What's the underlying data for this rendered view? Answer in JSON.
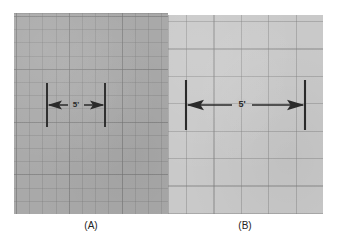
{
  "figure": {
    "background_color": "#ffffff",
    "panels": [
      {
        "id": "A",
        "caption": "(A)",
        "surface_color": "#a9a9a9",
        "grid_line_color": "#787878",
        "grid_description": "fine grid",
        "dimension": {
          "label": "5'",
          "style": "double-headed-arrow",
          "line_color": "#2a2a2a",
          "extension_tick_color": "#2a2a2a"
        }
      },
      {
        "id": "B",
        "caption": "(B)",
        "surface_color": "#c9c9c9",
        "grid_line_color": "#7d7d7d",
        "grid_description": "coarse grid",
        "dimension": {
          "label": "5'",
          "style": "double-headed-arrow",
          "line_color": "#2a2a2a",
          "extension_tick_color": "#2a2a2a"
        }
      }
    ]
  }
}
